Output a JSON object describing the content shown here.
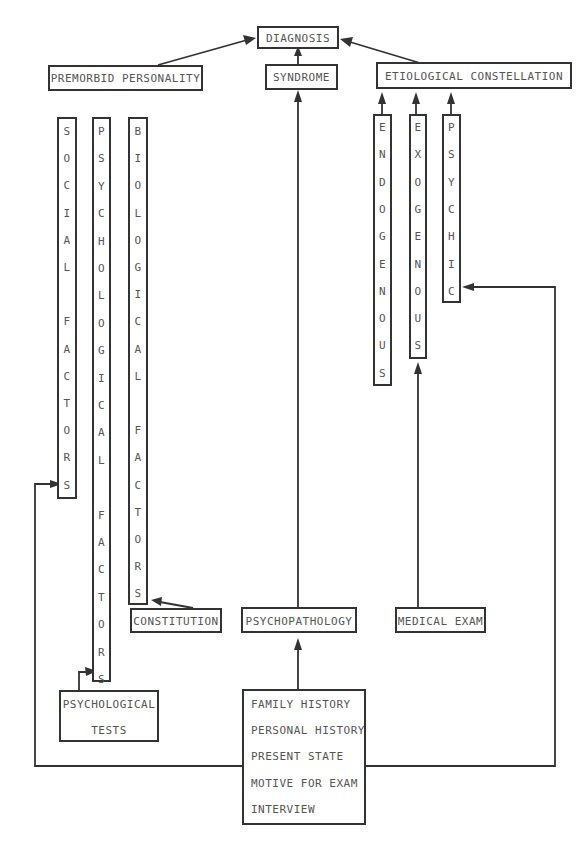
{
  "title_node": "DIAGNOSIS",
  "nodes": {
    "diagnosis": "DIAGNOSIS",
    "premorbid_personality": "PREMORBID PERSONALITY",
    "syndrome": "SYNDROME",
    "etiological_constellation": "ETIOLOGICAL CONSTELLATION",
    "social_factors": "SOCIAL FACTORS",
    "psychological_factors": "PSYCHOLOGICAL FACTORS",
    "biological_factors": "BIOLOGICAL FACTORS",
    "endogenous": "ENDOGENOUS",
    "exogenous": "EXOGENOUS",
    "psychic": "PSYCHIC",
    "constitution": "CONSTITUTION",
    "psychopathology": "PSYCHOPATHOLOGY",
    "medical_exam": "MEDICAL EXAM",
    "psychological_tests": [
      "PSYCHOLOGICAL",
      "TESTS"
    ],
    "interview_items": [
      "FAMILY HISTORY",
      "PERSONAL HISTORY",
      "PRESENT STATE",
      "MOTIVE FOR EXAM",
      "INTERVIEW"
    ]
  },
  "edges": [
    {
      "from": "premorbid_personality",
      "to": "diagnosis"
    },
    {
      "from": "syndrome",
      "to": "diagnosis"
    },
    {
      "from": "etiological_constellation",
      "to": "diagnosis"
    },
    {
      "from": "psychopathology",
      "to": "syndrome"
    },
    {
      "from": "endogenous",
      "to": "etiological_constellation"
    },
    {
      "from": "exogenous",
      "to": "etiological_constellation"
    },
    {
      "from": "psychic",
      "to": "etiological_constellation"
    },
    {
      "from": "medical_exam",
      "to": "exogenous"
    },
    {
      "from": "interview",
      "to": "psychopathology"
    },
    {
      "from": "interview",
      "to": "social_factors"
    },
    {
      "from": "interview",
      "to": "psychic"
    },
    {
      "from": "constitution",
      "to": "biological_factors"
    },
    {
      "from": "psychological_tests",
      "to": "psychological_factors"
    }
  ]
}
